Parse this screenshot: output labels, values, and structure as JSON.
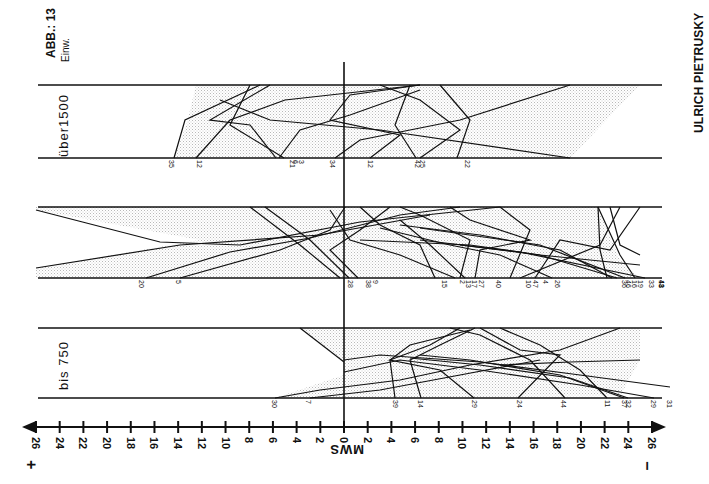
{
  "header": {
    "figure_label": "ABB.: 13",
    "unit_label": "Einw.",
    "author": "ULRICH PIETRUSKY"
  },
  "chart_data": {
    "type": "line",
    "title": "ABB.: 13",
    "xlabel": "MWS",
    "axis": {
      "ticks_left": [
        "26",
        "24",
        "22",
        "20",
        "18",
        "16",
        "14",
        "12",
        "10",
        "8",
        "6",
        "4",
        "2"
      ],
      "center": "0",
      "ticks_right": [
        "2",
        "4",
        "6",
        "8",
        "10",
        "12",
        "14",
        "16",
        "18",
        "20",
        "22",
        "24",
        "26"
      ],
      "left_sign": "+",
      "right_sign": "−",
      "range": [
        26,
        -26
      ],
      "left_arrow": true,
      "right_arrow": true
    },
    "bands": [
      {
        "name": "über 1500 Einw.",
        "label": "über1500",
        "station_labels": [
          {
            "id": "35",
            "mws": 14.6
          },
          {
            "id": "12",
            "mws": 12.2
          },
          {
            "id": "21",
            "mws": 4.4
          },
          {
            "id": "6",
            "mws": 4.1
          },
          {
            "id": "3",
            "mws": 3.6
          },
          {
            "id": "34",
            "mws": 1.0
          },
          {
            "id": "12",
            "mws": -2.2
          },
          {
            "id": "42",
            "mws": -6.2
          },
          {
            "id": "25",
            "mws": -6.6
          },
          {
            "id": "22",
            "mws": -10.4
          }
        ]
      },
      {
        "name": "Mittlere Größe",
        "label": "",
        "station_labels": [
          {
            "id": "20",
            "mws": 17.1
          },
          {
            "id": "5",
            "mws": 14.0
          },
          {
            "id": "28",
            "mws": -0.5
          },
          {
            "id": "38",
            "mws": -2.0
          },
          {
            "id": "9",
            "mws": -2.6
          },
          {
            "id": "15",
            "mws": -8.4
          },
          {
            "id": "2",
            "mws": -10.0
          },
          {
            "id": "13",
            "mws": -10.5
          },
          {
            "id": "17",
            "mws": -11.0
          },
          {
            "id": "27",
            "mws": -11.6
          },
          {
            "id": "40",
            "mws": -13.0
          },
          {
            "id": "10",
            "mws": -15.5
          },
          {
            "id": "47",
            "mws": -16.1
          },
          {
            "id": "4",
            "mws": -17.0
          },
          {
            "id": "26",
            "mws": -18.0
          },
          {
            "id": "36",
            "mws": -23.6
          },
          {
            "id": "46",
            "mws": -24.0
          },
          {
            "id": "16",
            "mws": -24.5
          },
          {
            "id": "19",
            "mws": -25.0
          },
          {
            "id": "33",
            "mws": -25.9
          },
          {
            "id": "41",
            "mws": -26.8
          },
          {
            "id": "43",
            "mws": -26.8
          },
          {
            "id": "18",
            "mws": -26.8
          }
        ]
      },
      {
        "name": "bis 750 Einw.",
        "label": "bis  750",
        "station_labels": [
          {
            "id": "30",
            "mws": 5.9
          },
          {
            "id": "7",
            "mws": 3.0
          },
          {
            "id": "39",
            "mws": -4.3
          },
          {
            "id": "14",
            "mws": -6.4
          },
          {
            "id": "29",
            "mws": -11.0
          },
          {
            "id": "24",
            "mws": -14.8
          },
          {
            "id": "44",
            "mws": -18.5
          },
          {
            "id": "11",
            "mws": -22.2
          },
          {
            "id": "37",
            "mws": -23.6
          },
          {
            "id": "32",
            "mws": -24.0
          },
          {
            "id": "29",
            "mws": -26.1
          },
          {
            "id": "31",
            "mws": -27.4
          }
        ]
      }
    ],
    "approximate_traces_note": "Intermediate polyline vertices below are hand-traced approximations used only to reproduce the visual look; they are not measured data.",
    "approximate_traces": [],
    "grid": false,
    "legend": null
  }
}
